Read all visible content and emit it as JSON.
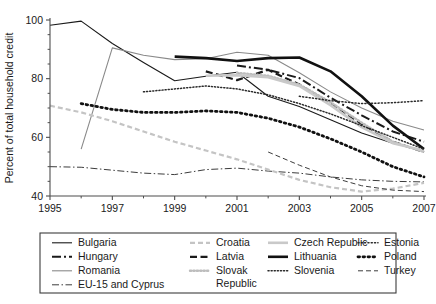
{
  "chart_data": {
    "type": "line",
    "title": "",
    "xlabel": "",
    "ylabel": "Percent of total household credit",
    "xlim": [
      1995,
      2007
    ],
    "ylim": [
      40,
      100
    ],
    "ytick_labels": [
      "40",
      "60",
      "80",
      "100"
    ],
    "ytick_values": [
      40,
      60,
      80,
      100
    ],
    "yminor_values": [
      45,
      50,
      55,
      65,
      70,
      75,
      85,
      90,
      95
    ],
    "xtick_labels": [
      "1995",
      "1997",
      "1999",
      "2001",
      "2003",
      "2005",
      "2007"
    ],
    "xtick_values": [
      1995,
      1997,
      1999,
      2001,
      2003,
      2005,
      2007
    ],
    "xminor_values": [
      1996,
      1998,
      2000,
      2002,
      2004,
      2006
    ],
    "grid": false,
    "legend_position": "below",
    "x": [
      1995,
      1996,
      1997,
      1998,
      1999,
      2000,
      2001,
      2002,
      2003,
      2004,
      2005,
      2006,
      2007
    ],
    "series": [
      {
        "name": "Bulgaria",
        "style": "solid-thin-black",
        "color": "#1a1a1a",
        "width": 1.1,
        "dash": "",
        "x": [
          1995,
          1996,
          1997,
          1998,
          1999,
          2000,
          2001,
          2002,
          2003,
          2004,
          2005,
          2006,
          2007
        ],
        "values": [
          98.2,
          99.6,
          92.0,
          85.5,
          79.3,
          80.8,
          82.2,
          74.0,
          70.5,
          66.0,
          61.5,
          58.0,
          55.5
        ]
      },
      {
        "name": "Hungary",
        "style": "dashdot-bold-black",
        "color": "#1a1a1a",
        "width": 2.0,
        "dash": "9,3,2,3",
        "x": [
          2001,
          2002,
          2003,
          2004,
          2005,
          2006,
          2007
        ],
        "values": [
          84.5,
          83.0,
          80.2,
          73.5,
          67.5,
          62.0,
          58.5
        ]
      },
      {
        "name": "Romania",
        "style": "solid-thin-gray",
        "color": "#8a8a8a",
        "width": 1.1,
        "dash": "",
        "x": [
          1996,
          1997,
          1998,
          1999,
          2000,
          2001,
          2002,
          2003,
          2004,
          2005,
          2006,
          2007
        ],
        "values": [
          56.0,
          90.5,
          88.0,
          86.5,
          86.8,
          89.0,
          88.0,
          82.0,
          75.5,
          70.0,
          65.5,
          62.5
        ]
      },
      {
        "name": "EU-15 and Cyprus",
        "style": "dashdot-thin-black",
        "color": "#3c3c3c",
        "width": 1.0,
        "dash": "7,2.5,1.5,2.5",
        "x": [
          1995,
          1996,
          1997,
          1998,
          1999,
          2000,
          2001,
          2002,
          2003,
          2004,
          2005,
          2006,
          2007
        ],
        "values": [
          50.0,
          49.8,
          48.8,
          47.8,
          47.3,
          49.0,
          49.5,
          48.5,
          47.8,
          46.5,
          45.5,
          45.0,
          44.8
        ]
      },
      {
        "name": "Croatia",
        "style": "dashed-light-gray",
        "color": "#c4c4c4",
        "width": 2.2,
        "dash": "5,3",
        "x": [
          1995,
          1996,
          1997,
          1998,
          1999,
          2000,
          2001,
          2002,
          2003,
          2004,
          2005,
          2006,
          2007
        ],
        "values": [
          70.8,
          68.5,
          65.5,
          62.0,
          58.5,
          55.5,
          52.5,
          49.0,
          45.5,
          43.0,
          41.5,
          42.5,
          44.5
        ]
      },
      {
        "name": "Latvia",
        "style": "dashed-bold-black",
        "color": "#1a1a1a",
        "width": 2.2,
        "dash": "7,3.5",
        "x": [
          2000,
          2001,
          2002,
          2003,
          2004,
          2005,
          2006,
          2007
        ],
        "values": [
          82.5,
          79.5,
          83.0,
          78.0,
          71.5,
          64.5,
          58.5,
          55.0
        ]
      },
      {
        "name": "Slovak Republic",
        "style": "dotted-light-gray",
        "color": "#bdbdbd",
        "width": 2.4,
        "dash": "1.2,2.2",
        "x": [
          2001,
          2002,
          2003,
          2004,
          2005,
          2006,
          2007
        ],
        "values": [
          82.0,
          81.0,
          78.0,
          72.0,
          65.0,
          58.5,
          55.0
        ]
      },
      {
        "name": "Czech Republic",
        "style": "solid-thick-light-gray",
        "color": "#c9c9c9",
        "width": 2.6,
        "dash": "",
        "x": [
          2000,
          2001,
          2002,
          2003,
          2004,
          2005,
          2006,
          2007
        ],
        "values": [
          81.0,
          81.2,
          80.5,
          77.5,
          71.0,
          63.5,
          58.0,
          55.5
        ]
      },
      {
        "name": "Lithuania",
        "style": "solid-thick-black",
        "color": "#111111",
        "width": 2.6,
        "dash": "",
        "x": [
          1999,
          2000,
          2001,
          2002,
          2003,
          2004,
          2005,
          2006,
          2007
        ],
        "values": [
          87.5,
          87.0,
          86.0,
          87.0,
          87.2,
          82.5,
          74.0,
          64.0,
          56.0
        ]
      },
      {
        "name": "Slovenia",
        "style": "dotted-fine-black",
        "color": "#2a2a2a",
        "width": 1.5,
        "dash": "1.1,2.0",
        "x": [
          1998,
          1999,
          2000,
          2001,
          2002,
          2003,
          2004,
          2005,
          2006,
          2007
        ],
        "values": [
          75.5,
          76.5,
          77.5,
          76.5,
          74.5,
          71.5,
          68.0,
          64.0,
          60.0,
          56.0
        ]
      },
      {
        "name": "Estonia",
        "style": "dotted-fine-black-right",
        "color": "#2a2a2a",
        "width": 1.5,
        "dash": "1.1,2.2",
        "x": [
          2003,
          2004,
          2005,
          2006,
          2007
        ],
        "values": [
          74.0,
          72.5,
          71.5,
          71.8,
          72.5
        ]
      },
      {
        "name": "Poland",
        "style": "dotted-bold-black",
        "color": "#111111",
        "width": 2.8,
        "dash": "1.6,3.4",
        "x": [
          1996,
          1997,
          1998,
          1999,
          2000,
          2001,
          2002,
          2003,
          2004,
          2005,
          2006,
          2007
        ],
        "values": [
          71.5,
          69.5,
          68.5,
          68.5,
          69.0,
          68.5,
          66.5,
          63.5,
          59.5,
          55.0,
          50.0,
          46.5
        ]
      },
      {
        "name": "Turkey",
        "style": "dashed-thin-black",
        "color": "#3c3c3c",
        "width": 1.0,
        "dash": "5,3,5,3",
        "x": [
          2002,
          2003,
          2004,
          2005,
          2006,
          2007
        ],
        "values": [
          55.0,
          50.5,
          46.5,
          43.5,
          42.0,
          41.5
        ]
      }
    ]
  },
  "axes": {
    "y_axis_title": "Percent of total household credit"
  },
  "legend": {
    "columns": [
      {
        "entries": [
          {
            "label": "Bulgaria",
            "series": "Bulgaria"
          },
          {
            "label": "Hungary",
            "series": "Hungary"
          },
          {
            "label": "Romania",
            "series": "Romania"
          },
          {
            "label": "EU-15 and Cyprus",
            "series": "EU-15 and Cyprus"
          }
        ]
      },
      {
        "entries": [
          {
            "label": "Croatia",
            "series": "Croatia"
          },
          {
            "label": "Latvia",
            "series": "Latvia"
          },
          {
            "label": "Slovak Republic",
            "series": "Slovak Republic"
          }
        ]
      },
      {
        "entries": [
          {
            "label": "Czech Republic",
            "series": "Czech Republic"
          },
          {
            "label": "Lithuania",
            "series": "Lithuania"
          },
          {
            "label": "Slovenia",
            "series": "Slovenia"
          }
        ]
      },
      {
        "entries": [
          {
            "label": "Estonia",
            "series": "Estonia"
          },
          {
            "label": "Poland",
            "series": "Poland"
          },
          {
            "label": "Turkey",
            "series": "Turkey"
          }
        ]
      }
    ]
  },
  "colors": {
    "axis": "#4d4d4d",
    "text": "#1a1a1a",
    "legend_border": "#3c3c3c",
    "background": "#ffffff"
  }
}
